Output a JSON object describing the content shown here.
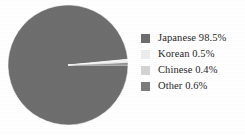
{
  "chart_data": {
    "type": "pie",
    "title": "",
    "subtitle": "",
    "xlabel": "",
    "ylabel": "",
    "legend_position": "right",
    "grid": false,
    "categories": [
      "Japanese",
      "Korean",
      "Chinese",
      "Other"
    ],
    "values": [
      98.5,
      0.5,
      0.4,
      0.6
    ],
    "value_unit": "%",
    "start_angle_deg": 0,
    "direction": "clockwise",
    "slices": [
      {
        "label": "Japanese",
        "value": 98.5,
        "display": "Japanese 98.5%",
        "color": "#6e6e6e"
      },
      {
        "label": "Korean",
        "value": 0.5,
        "display": "Korean 0.5%",
        "color": "#ededed"
      },
      {
        "label": "Chinese",
        "value": 0.4,
        "display": "Chinese 0.4%",
        "color": "#d4d4d4"
      },
      {
        "label": "Other",
        "value": 0.6,
        "display": "Other 0.6%",
        "color": "#7c7c7c"
      }
    ]
  },
  "legend": {
    "items": [
      {
        "label": "Japanese 98.5%",
        "color": "#6e6e6e"
      },
      {
        "label": "Korean 0.5%",
        "color": "#ededed"
      },
      {
        "label": "Chinese 0.4%",
        "color": "#d4d4d4"
      },
      {
        "label": "Other 0.6%",
        "color": "#7c7c7c"
      }
    ]
  },
  "colors": {
    "background": "#ffffff",
    "text": "#262626",
    "slice_primary": "#6e6e6e",
    "slice_secondary": "#ededed",
    "slice_tertiary": "#d4d4d4",
    "slice_quaternary": "#7c7c7c"
  }
}
